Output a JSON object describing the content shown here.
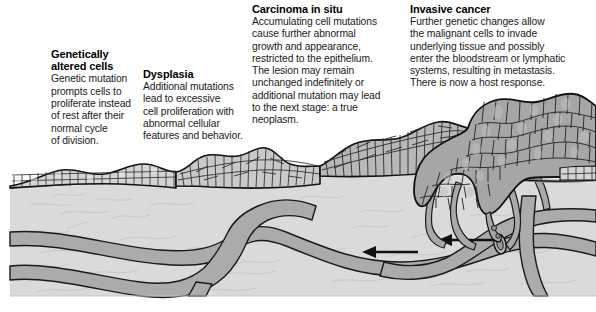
{
  "figure": {
    "type": "medical cross-section illustration"
  },
  "palette": {
    "background": "#ffffff",
    "stroma": "#d9d9d9",
    "stroma_light": "#e2e2e2",
    "vessel_fill": "#a9a9a9",
    "vessel_stroke": "#1a1a1a",
    "epithelium_cell": "#d2d2d2",
    "epithelium_cell_light": "#e8e8e8",
    "tumor_cell": "#a8a8a8",
    "basement_membrane": "#8f8f8f",
    "outline": "#111111",
    "text": "#111111",
    "heading": "#000000"
  },
  "captions": [
    {
      "id": "genetically-altered-cells",
      "heading": "Genetically\naltered cells",
      "heading_lines": [
        "Genetically",
        "altered cells"
      ],
      "body": "Genetic mutation prompts cells to proliferate instead of rest after their normal cycle of division.",
      "body_lines": [
        "Genetic mutation",
        "prompts cells to",
        "proliferate instead",
        "of rest after their",
        "normal cycle",
        "of division."
      ]
    },
    {
      "id": "dysplasia",
      "heading": "Dysplasia",
      "heading_lines": [
        "Dysplasia"
      ],
      "body": "Additional mutations lead to excessive cell proliferation with abnormal cellular features and behavior.",
      "body_lines": [
        "Additional mutations",
        "lead to excessive",
        "cell proliferation with",
        "abnormal cellular",
        "features and behavior."
      ]
    },
    {
      "id": "carcinoma-in-situ",
      "heading": "Carcinoma in situ",
      "heading_lines": [
        "Carcinoma in situ"
      ],
      "body": "Accumulating cell mutations cause further abnormal growth and appearance, restricted to the epithelium. The lesion may remain unchanged indefinitely or additional mutation may lead to the next stage: a true neoplasm.",
      "body_lines": [
        "Accumulating cell mutations",
        "cause further abnormal",
        "growth and appearance,",
        "restricted to the epithelium.",
        "The lesion may remain",
        "unchanged indefinitely or",
        "additional mutation may lead",
        "to the next stage: a true",
        "neoplasm."
      ]
    },
    {
      "id": "invasive-cancer",
      "heading": "Invasive cancer",
      "heading_lines": [
        "Invasive cancer"
      ],
      "body": "Further genetic changes allow the malignant cells to invade underlying tissue and possibly enter the bloodstream or lymphatic systems, resulting in metastasis. There is now a host response.",
      "body_lines": [
        "Further genetic changes allow",
        "the malignant cells to invade",
        "underlying tissue and possibly",
        "enter the bloodstream or lymphatic",
        "systems, resulting in metastasis.",
        "There is now a host response."
      ]
    }
  ],
  "illustration": {
    "regions": [
      {
        "name": "normal-epithelium",
        "label": "orderly stratified epithelial cell layers"
      },
      {
        "name": "dysplastic-epithelium",
        "label": "thickened disorganized epithelium"
      },
      {
        "name": "carcinoma-in-situ-epithelium",
        "label": "full-thickness abnormal cells above intact basement membrane"
      },
      {
        "name": "invasive-tumor-mass",
        "label": "irregular tumor mass breaching basement membrane"
      },
      {
        "name": "basement-membrane",
        "label": "basement membrane"
      },
      {
        "name": "stroma",
        "label": "underlying connective tissue"
      },
      {
        "name": "blood-vessels",
        "label": "blood and lymphatic vessels"
      },
      {
        "name": "tumor-neovessels",
        "label": "tumor-induced new vessels"
      },
      {
        "name": "metastasis-arrow",
        "label": "arrow showing cells entering bloodstream"
      }
    ]
  }
}
